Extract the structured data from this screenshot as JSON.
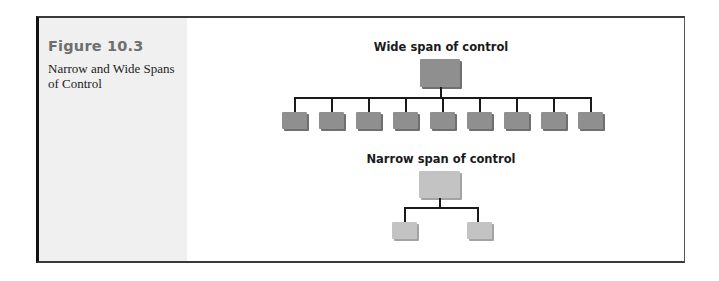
{
  "figure": {
    "number": "Figure 10.3",
    "caption": "Narrow and Wide Spans of Control"
  },
  "diagrams": [
    {
      "id": "wide",
      "title": "Wide span of control",
      "top_node_color": "#8f8f8f",
      "child_node_color": "#8f8f8f",
      "children_count": 9
    },
    {
      "id": "narrow",
      "title": "Narrow span of control",
      "top_node_color": "#c3c3c3",
      "child_node_color": "#c3c3c3",
      "children_count": 2
    }
  ],
  "colors": {
    "frame_border": "#3a3a3a",
    "sidebar_bg": "#f0f0f0",
    "figure_number": "#6e6e6e",
    "connector": "#1a1a1a"
  }
}
